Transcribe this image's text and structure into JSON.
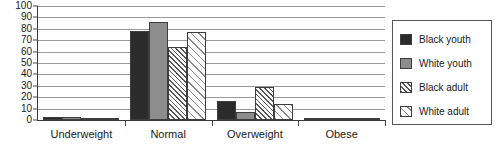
{
  "chart_data": {
    "type": "bar",
    "title": "",
    "subtitle": "",
    "xlabel": "",
    "ylabel": "",
    "categories": [
      "Underweight",
      "Normal",
      "Overweight",
      "Obese"
    ],
    "series": [
      {
        "name": "Black youth",
        "key": "black-youth",
        "color": "#2b2b2b",
        "pattern": "solid-dark",
        "values": [
          3,
          78,
          17,
          1
        ]
      },
      {
        "name": "White youth",
        "key": "white-youth",
        "color": "#8d8d8d",
        "pattern": "solid-gray",
        "values": [
          3,
          86,
          7,
          1
        ]
      },
      {
        "name": "Black adult",
        "key": "black-adult",
        "color": "#ffffff",
        "pattern": "dense-hatch",
        "values": [
          0,
          64,
          29,
          2
        ]
      },
      {
        "name": "White adult",
        "key": "white-adult",
        "color": "#ffffff",
        "pattern": "sparse-hatch",
        "values": [
          2,
          77,
          14,
          1
        ]
      }
    ],
    "ylim": [
      0,
      100
    ],
    "ytick_step": 10,
    "yticks": [
      0,
      10,
      20,
      30,
      40,
      50,
      60,
      70,
      80,
      90,
      100
    ],
    "ytick_labels": [
      "0",
      "10",
      "20",
      "30",
      "40",
      "50",
      "60",
      "70",
      "80",
      "90",
      "100"
    ],
    "grid": true,
    "grid_axis": "y",
    "legend_position": "right"
  },
  "legend": {
    "items": [
      {
        "label": "Black youth"
      },
      {
        "label": "White youth"
      },
      {
        "label": "Black adult"
      },
      {
        "label": "White adult"
      }
    ]
  }
}
